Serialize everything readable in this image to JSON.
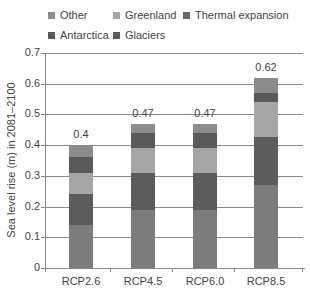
{
  "chart_data": {
    "type": "bar",
    "stacked": true,
    "title": "",
    "xlabel": "",
    "ylabel": "Sea level rise (m) in 2081–2100",
    "ylim": [
      0,
      0.7
    ],
    "yticks": [
      "0",
      "0.1",
      "0.2",
      "0.3",
      "0.4",
      "0.5",
      "0.6",
      "0.7"
    ],
    "grid": true,
    "legend_position": "top",
    "categories": [
      "RCP2.6",
      "RCP4.5",
      "RCP6.0",
      "RCP8.5"
    ],
    "totals": [
      "0.4",
      "0.47",
      "0.47",
      "0.62"
    ],
    "series": [
      {
        "name": "Thermal expansion",
        "color": "#7c7c7c",
        "values": [
          0.14,
          0.19,
          0.19,
          0.27
        ]
      },
      {
        "name": "Glaciers",
        "color": "#5c5c5c",
        "values": [
          0.1,
          0.12,
          0.12,
          0.155
        ]
      },
      {
        "name": "Greenland",
        "color": "#a6a6a6",
        "values": [
          0.07,
          0.08,
          0.08,
          0.115
        ]
      },
      {
        "name": "Antarctica",
        "color": "#5a5a5a",
        "values": [
          0.05,
          0.05,
          0.05,
          0.03
        ]
      },
      {
        "name": "Other",
        "color": "#8c8c8c",
        "values": [
          0.04,
          0.03,
          0.03,
          0.05
        ]
      }
    ]
  },
  "legend": [
    {
      "label": "Other",
      "color": "#8c8c8c"
    },
    {
      "label": "Greenland",
      "color": "#a6a6a6"
    },
    {
      "label": "Thermal expansion",
      "color": "#6a6a6a"
    },
    {
      "label": "Antarctica",
      "color": "#5a5a5a"
    },
    {
      "label": "Glaciers",
      "color": "#5c5c5c"
    }
  ]
}
